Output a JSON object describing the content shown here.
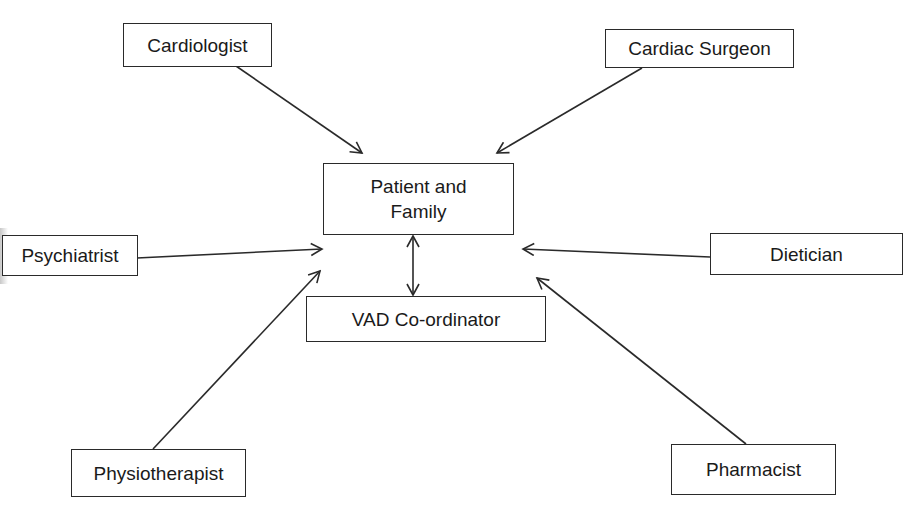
{
  "diagram": {
    "type": "hub-and-spoke",
    "colors": {
      "stroke": "#2a2a2a",
      "text": "#1a1a1a",
      "background": "#ffffff"
    },
    "nodes": {
      "cardiologist": {
        "label": "Cardiologist"
      },
      "cardiac_surgeon": {
        "label": "Cardiac Surgeon"
      },
      "patient_family": {
        "label": "Patient and\nFamily"
      },
      "psychiatrist": {
        "label": "Psychiatrist"
      },
      "dietician": {
        "label": "Dietician"
      },
      "vad_coordinator": {
        "label": "VAD Co-ordinator"
      },
      "physiotherapist": {
        "label": "Physiotherapist"
      },
      "pharmacist": {
        "label": "Pharmacist"
      }
    },
    "edges": [
      {
        "from": "Cardiologist",
        "to": "Patient and Family",
        "direction": "one-way"
      },
      {
        "from": "Cardiac Surgeon",
        "to": "Patient and Family",
        "direction": "one-way"
      },
      {
        "from": "Psychiatrist",
        "to": "Patient and Family",
        "direction": "one-way"
      },
      {
        "from": "Dietician",
        "to": "Patient and Family",
        "direction": "one-way"
      },
      {
        "from": "Physiotherapist",
        "to": "Patient and Family",
        "direction": "one-way"
      },
      {
        "from": "Pharmacist",
        "to": "Patient and Family",
        "direction": "one-way"
      },
      {
        "from": "Patient and Family",
        "to": "VAD Co-ordinator",
        "direction": "two-way"
      }
    ]
  }
}
